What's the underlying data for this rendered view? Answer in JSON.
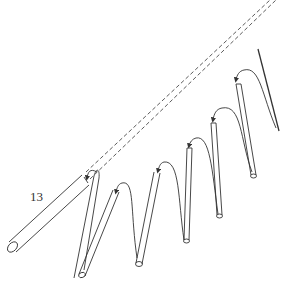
{
  "figure": {
    "label": "13",
    "colors": {
      "line": "#333333",
      "background": "#ffffff"
    }
  },
  "diagram": {
    "nodes": [
      {
        "id": "segment-main",
        "label": "13",
        "type": "tube"
      },
      {
        "id": "segment-2",
        "type": "tube"
      },
      {
        "id": "segment-3",
        "type": "tube"
      },
      {
        "id": "segment-4",
        "type": "tube"
      },
      {
        "id": "segment-5",
        "type": "tube"
      },
      {
        "id": "segment-6",
        "type": "tube"
      },
      {
        "id": "segment-tip",
        "type": "rod"
      }
    ],
    "edges": [
      {
        "from": "segment-2",
        "to": "segment-main",
        "style": "curved-arrow"
      },
      {
        "from": "segment-3",
        "to": "segment-2",
        "style": "curved-arrow"
      },
      {
        "from": "segment-4",
        "to": "segment-3",
        "style": "curved-arrow"
      },
      {
        "from": "segment-5",
        "to": "segment-4",
        "style": "curved-arrow"
      },
      {
        "from": "segment-6",
        "to": "segment-5",
        "style": "curved-arrow"
      },
      {
        "from": "segment-tip",
        "to": "segment-6",
        "style": "curved-arrow"
      },
      {
        "from": "segment-main",
        "to": "extended-position",
        "style": "dashed-projection"
      }
    ]
  }
}
